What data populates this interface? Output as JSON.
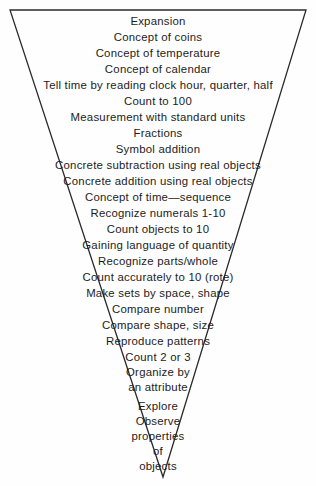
{
  "diagram": {
    "type": "inverted-triangle-funnel",
    "title_visible": false,
    "outline_color": "#2b2b2b",
    "background_color": "#fefefe",
    "text_color": "#1c1c1c",
    "apex": "bottom",
    "order": "most-advanced-at-top-widest-to-most-basic-at-bottom-narrowest",
    "levels": [
      {
        "label": "Expansion"
      },
      {
        "label": "Concept of coins"
      },
      {
        "label": "Concept of temperature"
      },
      {
        "label": "Concept of calendar"
      },
      {
        "label": "Tell time by reading clock hour, quarter, half"
      },
      {
        "label": "Count to 100"
      },
      {
        "label": "Measurement with standard units"
      },
      {
        "label": "Fractions"
      },
      {
        "label": "Symbol addition"
      },
      {
        "label": "Concrete subtraction using real objects"
      },
      {
        "label": "Concrete addition using real objects"
      },
      {
        "label": "Concept of time—sequence"
      },
      {
        "label": "Recognize numerals 1-10"
      },
      {
        "label": "Count objects to 10"
      },
      {
        "label": "Gaining language of quantity"
      },
      {
        "label": "Recognize parts/whole"
      },
      {
        "label": "Count accurately to 10 (rote)"
      },
      {
        "label": "Make sets by space, shape"
      },
      {
        "label": "Compare number"
      },
      {
        "label": "Compare shape, size"
      },
      {
        "label": "Reproduce patterns"
      },
      {
        "label": "Count 2 or 3"
      },
      {
        "label": "Organize by"
      },
      {
        "label": "an attribute"
      },
      {
        "label": "Explore",
        "extra_space_before": true
      },
      {
        "label": "Observe"
      },
      {
        "label": "properties"
      },
      {
        "label": "of"
      },
      {
        "label": "objects"
      }
    ]
  }
}
